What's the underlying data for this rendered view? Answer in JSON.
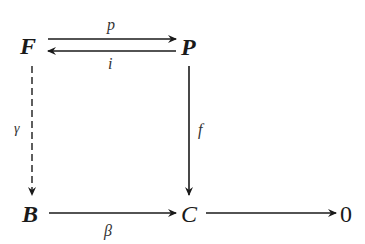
{
  "diagram": {
    "type": "commutative-diagram",
    "nodes": {
      "F": "F",
      "P": "P",
      "B": "B",
      "C": "C",
      "zero": "0"
    },
    "edges": [
      {
        "from": "F",
        "to": "P",
        "label": "p",
        "style": "solid",
        "label_position": "above"
      },
      {
        "from": "P",
        "to": "F",
        "label": "i",
        "style": "solid",
        "label_position": "below"
      },
      {
        "from": "F",
        "to": "B",
        "label": "γ",
        "style": "dashed",
        "label_position": "left"
      },
      {
        "from": "P",
        "to": "C",
        "label": "f",
        "style": "solid",
        "label_position": "right"
      },
      {
        "from": "B",
        "to": "C",
        "label": "β",
        "style": "solid",
        "label_position": "below"
      },
      {
        "from": "C",
        "to": "0",
        "label": "",
        "style": "solid"
      }
    ],
    "labels": {
      "p": "p",
      "i": "i",
      "gamma": "γ",
      "f": "f",
      "beta": "β"
    },
    "colors": {
      "ink": "#1a1a1a",
      "background": "#ffffff"
    }
  }
}
